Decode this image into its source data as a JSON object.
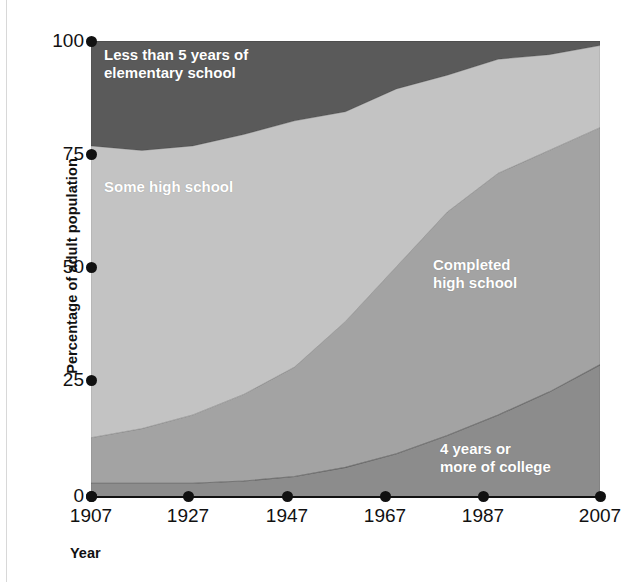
{
  "chart_data": {
    "type": "area",
    "title": "",
    "subtitle": "",
    "xlabel": "Year",
    "ylabel": "Percentage of adult population",
    "stacked": true,
    "stack_order": "bottom-to-top",
    "grid": false,
    "legend": "inline-band-labels",
    "xlim": [
      1907,
      2007
    ],
    "ylim": [
      0,
      100
    ],
    "x_tick_labels": [
      "1907",
      "1927",
      "1947",
      "1967",
      "1987",
      "2007"
    ],
    "y_tick_labels": [
      "0",
      "25",
      "50",
      "75",
      "100"
    ],
    "x": [
      1907,
      1917,
      1927,
      1937,
      1947,
      1957,
      1967,
      1977,
      1987,
      1997,
      2007
    ],
    "series": [
      {
        "name": "4 years or more of college",
        "color": "#8c8c8c",
        "values": [
          3,
          3,
          3,
          3.5,
          4.5,
          6.5,
          9.5,
          13.5,
          18,
          23,
          29
        ]
      },
      {
        "name": "Completed high school",
        "color": "#a3a3a3",
        "values": [
          10,
          12,
          15,
          19,
          24,
          32,
          41,
          49,
          53,
          53,
          52
        ]
      },
      {
        "name": "Some high school",
        "color": "#c3c3c3",
        "values": [
          64,
          61,
          59,
          57,
          54,
          46,
          39,
          30,
          25,
          21,
          18
        ]
      },
      {
        "name": "Less than 5 years of elementary school",
        "color": "#5a5a5a",
        "values": [
          23,
          24,
          23,
          20.5,
          17.5,
          15.5,
          10.5,
          7.5,
          4,
          3,
          1
        ]
      }
    ],
    "cumulative_tops": {
      "4 years or more of college": [
        3,
        3,
        3,
        3.5,
        4.5,
        6.5,
        9.5,
        13.5,
        18,
        23,
        29
      ],
      "Completed high school": [
        13,
        15,
        18,
        22.5,
        28.5,
        38.5,
        50.5,
        62.5,
        71,
        76,
        81
      ],
      "Some high school": [
        77,
        76,
        77,
        79.5,
        82.5,
        84.5,
        89.5,
        92.5,
        96,
        97,
        99
      ],
      "Less than 5 years of elementary school": [
        100,
        100,
        100,
        100,
        100,
        100,
        100,
        100,
        100,
        100,
        100
      ]
    }
  },
  "labels": {
    "band_top": "Less than 5 years of\nelementary school",
    "band_second": "Some high school",
    "band_third": "Completed\nhigh school",
    "band_bottom": "4 years or\nmore of college"
  },
  "axes": {
    "y_title": "Percentage of adult population",
    "x_title": "Year",
    "y_ticks": [
      "100",
      "75",
      "50",
      "25",
      "0"
    ],
    "x_ticks": [
      "1907",
      "1927",
      "1947",
      "1967",
      "1987",
      "2007"
    ]
  },
  "colors": {
    "band_top": "#5a5a5a",
    "band_second": "#c3c3c3",
    "band_third": "#a3a3a3",
    "band_bottom": "#8c8c8c",
    "axis": "#111111",
    "label_text": "#ffffff"
  }
}
